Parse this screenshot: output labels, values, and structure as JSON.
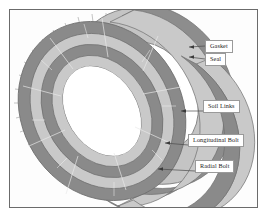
{
  "figure": {
    "kind": "technical-illustration",
    "frame_color": "#6b6b6b",
    "background": "#ffffff"
  },
  "ring_model": {
    "projection": "isometric-perspective",
    "band_count": 4,
    "segments_per_ring": 8,
    "colors": {
      "dark_band": "#8d8d8d",
      "dark_band_shaded": "#7a7a7a",
      "light_band": "#c9c9c9",
      "light_band_shaded": "#b6b6b6",
      "edge_line": "#6f6f6f",
      "joint_line": "#e8e8e8",
      "bolt_tick": "#a0a0a0",
      "bore": "#ffffff"
    },
    "bands": [
      {
        "index": 0,
        "tone": "dark"
      },
      {
        "index": 1,
        "tone": "light"
      },
      {
        "index": 2,
        "tone": "dark"
      },
      {
        "index": 3,
        "tone": "light"
      }
    ],
    "radial_bolt_tick_count": 26
  },
  "callouts": [
    {
      "id": "gasket",
      "label": "Gasket",
      "arrow_tip_x": 189,
      "arrow_tip_y": 47
    },
    {
      "id": "seal",
      "label": "Seal",
      "arrow_tip_x": 189,
      "arrow_tip_y": 57
    },
    {
      "id": "soil_links",
      "label": "Soil Links",
      "arrow_tip_x": 181,
      "arrow_tip_y": 105
    },
    {
      "id": "longitudinal",
      "label": "Longitudinal Bolt",
      "arrow_tip_x": 165,
      "arrow_tip_y": 139
    },
    {
      "id": "radial",
      "label": "Radial Bolt",
      "arrow_tip_x": 158,
      "arrow_tip_y": 165
    }
  ]
}
